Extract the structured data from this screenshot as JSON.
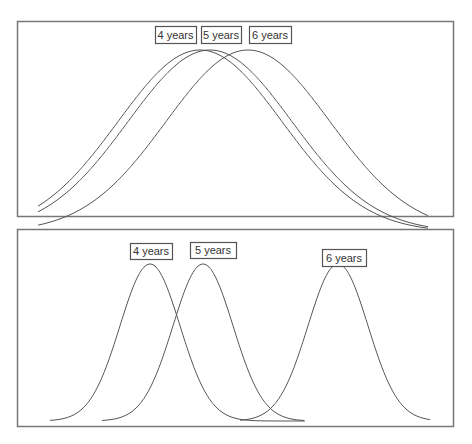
{
  "chart_data": [
    {
      "type": "line",
      "title": "",
      "description": "Three widely overlapping normal curves",
      "xlabel": "",
      "ylabel": "",
      "grid": false,
      "legend_position": "inline labels above peaks",
      "series": [
        {
          "name": "4 years",
          "mean_px": 200,
          "sd_px": 82
        },
        {
          "name": "5 years",
          "mean_px": 210,
          "sd_px": 82
        },
        {
          "name": "6 years",
          "mean_px": 248,
          "sd_px": 82
        }
      ],
      "frame": {
        "x": 17,
        "y": 21,
        "w": 436,
        "h": 195
      },
      "curve_range_px": [
        38,
        428
      ],
      "peak_y": 50,
      "base_y": 232,
      "labels": [
        {
          "text": "4 years",
          "x": 155,
          "y": 26,
          "w": 41,
          "h": 17
        },
        {
          "text": "5 years",
          "x": 201,
          "y": 26,
          "w": 40,
          "h": 17
        },
        {
          "text": "6 years",
          "x": 249,
          "y": 26,
          "w": 42,
          "h": 17
        }
      ]
    },
    {
      "type": "line",
      "title": "",
      "description": "Three narrow, mostly separated normal curves",
      "xlabel": "",
      "ylabel": "",
      "grid": false,
      "legend_position": "inline labels above peaks",
      "series": [
        {
          "name": "4 years",
          "mean_px": 150,
          "sd_px": 30,
          "range_px": [
            50,
            305
          ]
        },
        {
          "name": "5 years",
          "mean_px": 203,
          "sd_px": 30,
          "range_px": [
            102,
            304
          ]
        },
        {
          "name": "6 years",
          "mean_px": 338,
          "sd_px": 30,
          "range_px": [
            240,
            430
          ]
        }
      ],
      "frame": {
        "x": 17,
        "y": 229,
        "w": 436,
        "h": 197
      },
      "peak_y": 264,
      "base_y": 421,
      "labels": [
        {
          "text": "4 years",
          "x": 130,
          "y": 243,
          "w": 42,
          "h": 16
        },
        {
          "text": "5 years",
          "x": 190,
          "y": 242,
          "w": 46,
          "h": 16
        },
        {
          "text": "6 years",
          "x": 322,
          "y": 249,
          "w": 44,
          "h": 17
        }
      ]
    }
  ],
  "style": {
    "line_color": "#555555",
    "frame_color": "#777777",
    "label_border": "#555555",
    "background": "#ffffff"
  }
}
